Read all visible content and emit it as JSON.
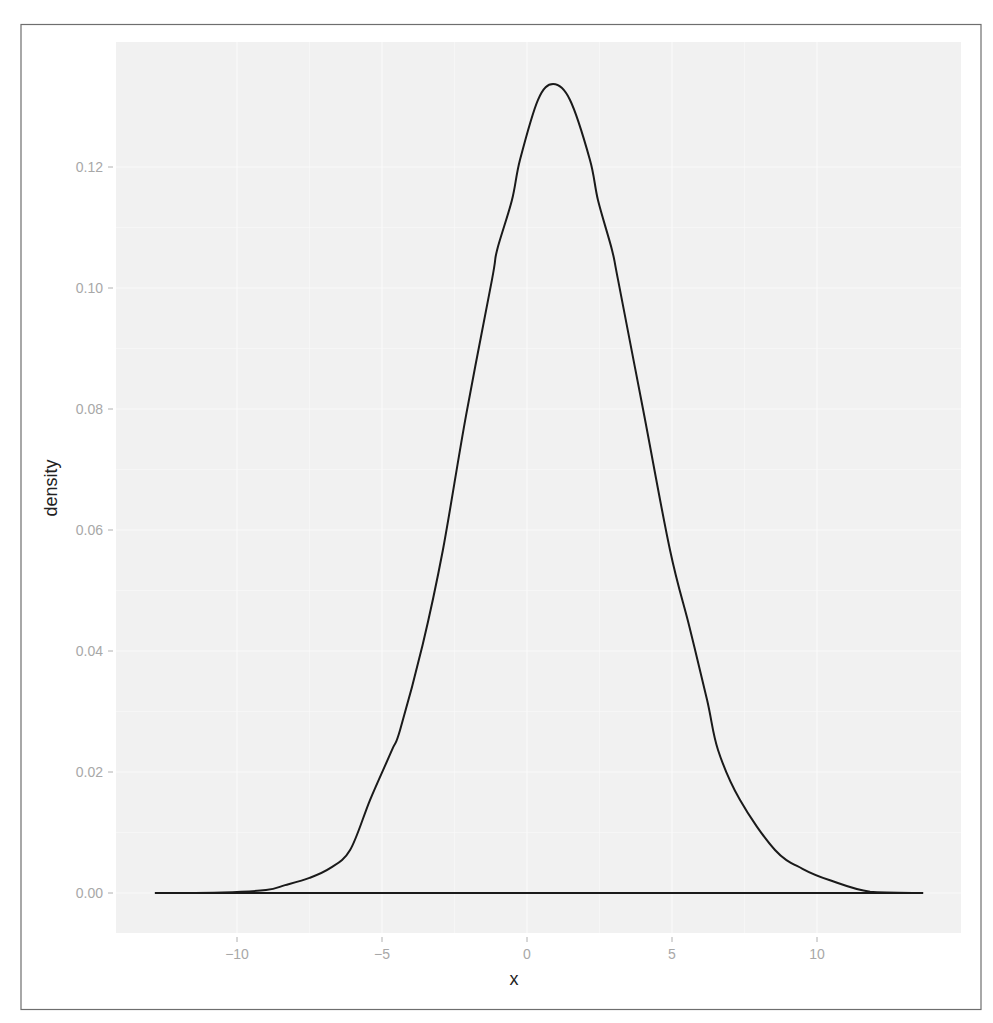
{
  "chart_data": {
    "type": "line",
    "title": "",
    "xlabel": "x",
    "ylabel": "density",
    "xlim": [
      -14.0,
      14.8
    ],
    "ylim": [
      -0.0066,
      0.14
    ],
    "grid": true,
    "legend": null,
    "x_ticks": [
      -10,
      -5,
      0,
      5,
      10
    ],
    "x_tick_labels": [
      "−10",
      "−5",
      "0",
      "5",
      "10"
    ],
    "y_ticks": [
      0.0,
      0.02,
      0.04,
      0.06,
      0.08,
      0.1,
      0.12
    ],
    "y_tick_labels": [
      "0.00",
      "0.02",
      "0.04",
      "0.06",
      "0.08",
      "0.10",
      "0.12"
    ],
    "series": [
      {
        "name": "density",
        "color": "#1a1a1a",
        "x": [
          -12.83,
          -10.5,
          -9.0,
          -8.34,
          -7.5,
          -6.79,
          -6.1,
          -5.41,
          -4.66,
          -4.38,
          -3.6,
          -2.9,
          -2.1,
          -1.21,
          -1.03,
          -0.52,
          -0.24,
          0.38,
          0.9,
          1.48,
          2.17,
          2.45,
          2.93,
          3.14,
          4.0,
          4.93,
          5.6,
          6.21,
          6.59,
          7.34,
          8.55,
          9.5,
          10.45,
          11.83,
          13.66
        ],
        "y": [
          0.0,
          0.0001,
          0.0005,
          0.0013,
          0.0025,
          0.0041,
          0.0071,
          0.0154,
          0.0236,
          0.0269,
          0.041,
          0.0567,
          0.079,
          0.1013,
          0.1063,
          0.1145,
          0.1212,
          0.1311,
          0.1337,
          0.1311,
          0.1212,
          0.1145,
          0.1063,
          0.1013,
          0.08,
          0.0567,
          0.044,
          0.0319,
          0.0236,
          0.0154,
          0.0071,
          0.004,
          0.0021,
          0.0002,
          0.0
        ]
      }
    ],
    "baseline": {
      "y": 0.0,
      "x_from": -12.83,
      "x_to": 13.66
    }
  },
  "colors": {
    "panel_background": "#f1f1f1",
    "grid_major": "#fafafa",
    "line": "#1a1a1a",
    "tick_text": "#a8a8a8",
    "axis_title": "#222222",
    "frame": "#6e6e6e"
  }
}
